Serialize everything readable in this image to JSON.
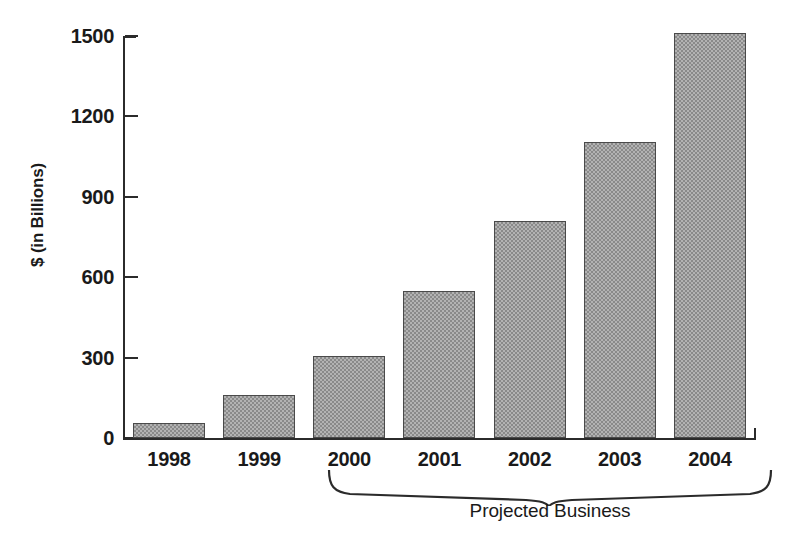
{
  "chart_data": {
    "type": "bar",
    "title": "",
    "subtitle": "",
    "xlabel": "",
    "ylabel": "$ (in Billions)",
    "categories": [
      "1998",
      "1999",
      "2000",
      "2001",
      "2002",
      "2003",
      "2004"
    ],
    "values": [
      55,
      160,
      305,
      550,
      810,
      1105,
      1510
    ],
    "series": [
      {
        "name": "Business",
        "values": [
          55,
          160,
          305,
          550,
          810,
          1105,
          1510
        ]
      }
    ],
    "ylim": [
      0,
      1500
    ],
    "yticks": [
      0,
      300,
      600,
      900,
      1200,
      1500
    ],
    "ytick_labels": [
      "0",
      "300",
      "600",
      "900",
      "1200",
      "1500"
    ],
    "grid": false,
    "legend": null,
    "legend_position": "none",
    "annotations": [
      {
        "name": "projected-business-brace",
        "label": "Projected Business",
        "spans_categories": [
          "2001",
          "2002",
          "2003",
          "2004"
        ]
      }
    ],
    "bar_fill_color": "#b3b3b3",
    "bar_edge_color": "#4a4a4a",
    "axis_color": "#2b2b2b"
  },
  "axis": {
    "y_title": "$ (in Billions)"
  },
  "annotation": {
    "projected_label": "Projected Business"
  }
}
